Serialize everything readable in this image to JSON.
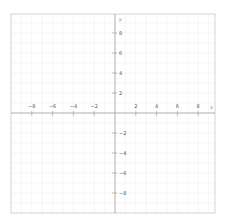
{
  "chart_data": {
    "type": "line",
    "title": "",
    "xlabel": "x",
    "ylabel": "y",
    "xlim": [
      -10,
      10
    ],
    "ylim": [
      -10,
      10
    ],
    "grid": true,
    "x_ticks": [
      -8,
      -6,
      -4,
      -2,
      2,
      4,
      6,
      8
    ],
    "y_ticks": [
      8,
      6,
      4,
      2,
      -2,
      -4,
      -6,
      -8
    ],
    "x_tick_labels": [
      "−8",
      "−6",
      "−4",
      "−2",
      "2",
      "4",
      "6",
      "8"
    ],
    "y_tick_labels": [
      "8",
      "6",
      "4",
      "2",
      "−2",
      "−4",
      "−6",
      "−8"
    ],
    "series": [],
    "legend": null
  },
  "colors": {
    "frame": "#c8c8c8",
    "axis": "#9a9a9a",
    "grid": "#f0f0f0",
    "text": "#555555"
  }
}
